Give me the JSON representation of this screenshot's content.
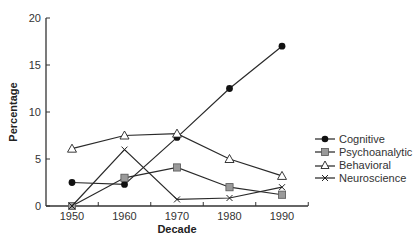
{
  "chart_data": {
    "type": "line",
    "title": "",
    "xlabel": "Decade",
    "ylabel": "Percentage",
    "x": [
      1950,
      1960,
      1970,
      1980,
      1990
    ],
    "x_tick_labels": [
      "1950",
      "1960",
      "1970",
      "1980",
      "1990"
    ],
    "y_ticks": [
      0,
      5,
      10,
      15,
      20
    ],
    "y_tick_labels": [
      "0",
      "5",
      "10",
      "15",
      "20"
    ],
    "ylim": [
      0,
      20
    ],
    "grid": false,
    "legend_position": "right",
    "series": [
      {
        "name": "Cognitive",
        "marker": "filled-circle",
        "color": "#111111",
        "values": [
          2.5,
          2.3,
          7.3,
          12.5,
          17.0
        ]
      },
      {
        "name": "Psychoanalytic",
        "marker": "gray-square",
        "color": "#999999",
        "values": [
          0.0,
          3.0,
          4.1,
          2.0,
          1.2
        ]
      },
      {
        "name": "Behavioral",
        "marker": "open-triangle",
        "color": "#ffffff",
        "values": [
          6.1,
          7.5,
          7.7,
          5.0,
          3.2
        ]
      },
      {
        "name": "Neuroscience",
        "marker": "x-cross",
        "color": "#111111",
        "values": [
          0.0,
          6.0,
          0.7,
          0.85,
          2.0
        ]
      }
    ]
  },
  "legend": {
    "items": [
      {
        "label": "Cognitive"
      },
      {
        "label": "Psychoanalytic"
      },
      {
        "label": "Behavioral"
      },
      {
        "label": "Neuroscience"
      }
    ]
  },
  "axes": {
    "x_title": "Decade",
    "y_title": "Percentage"
  }
}
